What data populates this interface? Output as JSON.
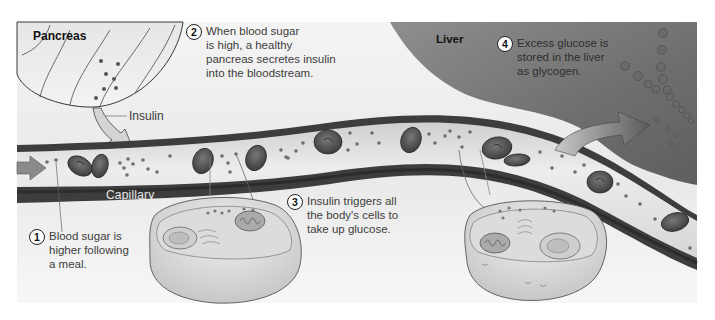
{
  "figure": {
    "organs": {
      "pancreas": "Pancreas",
      "liver": "Liver"
    },
    "labels": {
      "insulin": "Insulin",
      "capillary": "Capillary"
    },
    "steps": [
      {
        "number": "1",
        "text": "Blood sugar is\nhigher following\na meal."
      },
      {
        "number": "2",
        "text": "When blood sugar\nis high, a healthy\npancreas secretes insulin\ninto the bloodstream."
      },
      {
        "number": "3",
        "text": "Insulin triggers all\nthe body's cells to\ntake up glucose."
      },
      {
        "number": "4",
        "text": "Excess glucose is\nstored in the liver\nas glycogen."
      }
    ],
    "colors": {
      "background": "#ffffff",
      "panel": "#ececec",
      "liver": "#7a7a7a",
      "vessel_wall": "#3c3c3c",
      "vessel_lumen": "#e4e4e4",
      "red_cell": "#555555",
      "glucose_dot": "#6a6a6a",
      "text": "#3d3d3d"
    }
  }
}
